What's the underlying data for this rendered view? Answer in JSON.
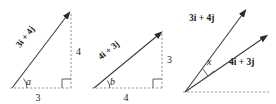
{
  "figure": {
    "background_color": "#ffffff",
    "line_color": "#3a3a3a",
    "dashed_color": "#9a9a9a",
    "text_color": "#1a1a1a"
  },
  "panels": [
    {
      "id": "panel-1",
      "vector_label": "3i + 4j",
      "angle_label": "a",
      "horizontal_label": "3",
      "vertical_label": "4",
      "has_right_angle": true,
      "has_arrow": true
    },
    {
      "id": "panel-2",
      "vector_label": "4i + 3j",
      "angle_label": "b",
      "horizontal_label": "4",
      "vertical_label": "3",
      "has_right_angle": true,
      "has_arrow": true
    },
    {
      "id": "panel-3",
      "upper_vector_label": "3i + 4j",
      "lower_vector_label": "4i + 3j",
      "angle_label": "x",
      "has_right_angle": true,
      "has_baseline": true
    }
  ]
}
